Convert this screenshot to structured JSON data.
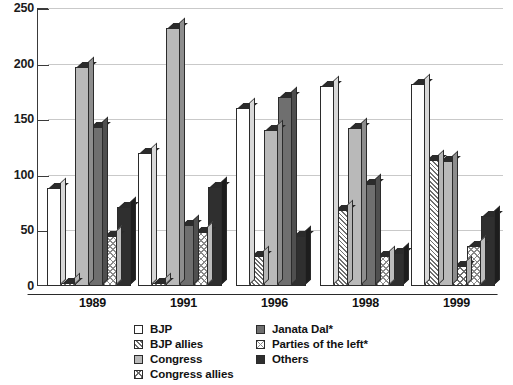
{
  "chart_data": {
    "type": "bar",
    "title": "",
    "xlabel": "",
    "ylabel": "",
    "categories": [
      "1989",
      "1991",
      "1996",
      "1998",
      "1999"
    ],
    "ylim": [
      0,
      250
    ],
    "yticks": [
      0,
      50,
      100,
      150,
      200,
      250
    ],
    "grid": true,
    "legend_position": "bottom",
    "series": [
      {
        "name": "BJP",
        "fill": "white",
        "values": [
          88,
          120,
          160,
          180,
          182
        ]
      },
      {
        "name": "BJP allies",
        "fill": "hatch",
        "values": [
          3,
          3,
          27,
          68,
          113
        ]
      },
      {
        "name": "Congress",
        "fill": "lgray",
        "values": [
          197,
          232,
          140,
          142,
          112
        ]
      },
      {
        "name": "Congress allies",
        "fill": "check",
        "values": [
          0,
          0,
          0,
          0,
          18
        ]
      },
      {
        "name": "Janata Dal*",
        "fill": "mgray",
        "values": [
          143,
          55,
          170,
          92,
          0
        ]
      },
      {
        "name": "Parties of the left*",
        "fill": "checkl",
        "values": [
          45,
          49,
          0,
          27,
          36
        ]
      },
      {
        "name": "Others",
        "fill": "dark",
        "values": [
          71,
          89,
          45,
          30,
          63
        ]
      }
    ]
  },
  "axis": {
    "y_tick_labels": [
      "250",
      "200",
      "150",
      "100",
      "50",
      "0"
    ]
  },
  "legend": {
    "column_a": [
      {
        "label": "BJP",
        "fill": "white"
      },
      {
        "label": "BJP allies",
        "fill": "hatch"
      },
      {
        "label": "Congress",
        "fill": "lgray"
      },
      {
        "label": "Congress allies",
        "fill": "check"
      }
    ],
    "column_b": [
      {
        "label": "Janata Dal*",
        "fill": "mgray"
      },
      {
        "label": "Parties of the left*",
        "fill": "checkl"
      },
      {
        "label": "Others",
        "fill": "dark"
      }
    ]
  }
}
